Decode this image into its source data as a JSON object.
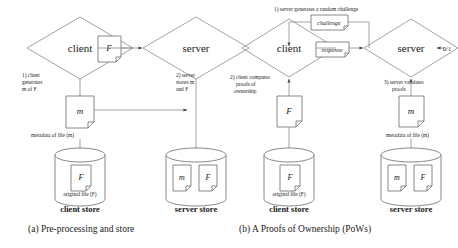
{
  "figure": {
    "panels": [
      {
        "id": "panel-a",
        "caption": "(a) Pre-processing and store",
        "nodes": {
          "client": "client",
          "server": "server",
          "file_box": "F",
          "metadata_box": "m"
        },
        "annotations": {
          "step1_line1": "1) client",
          "step1_line2": "generates",
          "step1_line3": "m of F",
          "step2_line1": "2) server",
          "step2_line2": "stores m",
          "step2_line3": "and F",
          "metadata_caption": "metadata of file (m)",
          "original_caption": "original file (F)"
        },
        "stores": [
          {
            "label": "client store",
            "docs": [
              "F"
            ]
          },
          {
            "label": "server store",
            "docs": [
              "m",
              "F"
            ]
          }
        ]
      },
      {
        "id": "panel-b",
        "caption": "(b) A Proofs of Ownership (PoWs)",
        "nodes": {
          "client": "client",
          "server": "server",
          "challenge_box": "challenge",
          "response_box": "response",
          "proof_box": "F",
          "metadata_box": "m",
          "output": "0/1"
        },
        "annotations": {
          "step1": "1) server generates a random challenge",
          "step2_line1": "2) client computes",
          "step2_line2": "proofs of",
          "step2_line3": "ownership",
          "step3_line1": "3) server validates",
          "step3_line2": "proofs",
          "metadata_caption": "metadata of file (m)",
          "original_caption": "original file (F)"
        },
        "stores": [
          {
            "label": "client store",
            "docs": [
              "F"
            ]
          },
          {
            "label": "server store",
            "docs": [
              "m",
              "F"
            ]
          }
        ]
      }
    ],
    "colors": {
      "stroke": "#4d4d4d",
      "text": "#1a1a1a",
      "background": "#ffffff"
    }
  }
}
